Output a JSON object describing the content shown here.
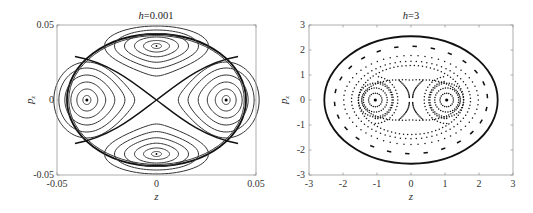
{
  "figure": {
    "panels": [
      {
        "title_var": "h",
        "title_value": "=0.001",
        "xlabel": "z",
        "ylabel": "p",
        "ylabel_sub": "z",
        "xticks": [
          "-0.05",
          "0",
          "0.05"
        ],
        "yticks": [
          "0.05",
          "0",
          "-0.05"
        ]
      },
      {
        "title_var": "h",
        "title_value": "=3",
        "xlabel": "z",
        "ylabel": "p",
        "ylabel_sub": "z",
        "xticks": [
          "-3",
          "-2",
          "-1",
          "0",
          "1",
          "2",
          "3"
        ],
        "yticks": [
          "3",
          "2",
          "1",
          "0",
          "-1",
          "-2",
          "-3"
        ]
      }
    ]
  },
  "chart_data": [
    {
      "type": "line",
      "subtype": "phase_portrait",
      "title": "h=0.001",
      "xlabel": "z",
      "ylabel": "p_z",
      "xlim": [
        -0.05,
        0.05
      ],
      "ylim": [
        -0.05,
        0.05
      ],
      "xticks": [
        -0.05,
        0,
        0.05
      ],
      "yticks": [
        -0.05,
        0,
        0.05
      ],
      "grid": false,
      "boundary": {
        "shape": "ellipse",
        "a": 0.045,
        "b": 0.044
      },
      "fixed_points": [
        {
          "z": -0.035,
          "p": 0,
          "type": "center"
        },
        {
          "z": 0.035,
          "p": 0,
          "type": "center"
        },
        {
          "z": 0,
          "p": 0.036,
          "type": "center"
        },
        {
          "z": 0,
          "p": -0.036,
          "type": "center"
        },
        {
          "z": 0,
          "p": 0,
          "type": "saddle"
        }
      ],
      "style": "continuous solid curves"
    },
    {
      "type": "scatter",
      "subtype": "poincare_section",
      "title": "h=3",
      "xlabel": "z",
      "ylabel": "p_z",
      "xlim": [
        -3,
        3
      ],
      "ylim": [
        -3,
        3
      ],
      "xticks": [
        -3,
        -2,
        -1,
        0,
        1,
        2,
        3
      ],
      "yticks": [
        -3,
        -2,
        -1,
        0,
        1,
        2,
        3
      ],
      "grid": false,
      "boundary": {
        "shape": "ellipse",
        "a": 2.55,
        "b": 2.55
      },
      "fixed_points": [
        {
          "z": -1.05,
          "p": 0,
          "type": "center"
        },
        {
          "z": 1.05,
          "p": 0,
          "type": "center"
        },
        {
          "z": 0,
          "p": 0,
          "type": "saddle"
        }
      ],
      "style": "dotted invariant curves"
    }
  ]
}
